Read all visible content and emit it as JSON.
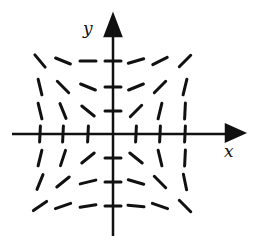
{
  "diagram": {
    "type": "slope_field",
    "axes": {
      "x_label": "x",
      "y_label": "y",
      "origin_px": [
        113,
        134
      ],
      "color": "#111111"
    },
    "grid": {
      "x_values": [
        -3,
        -2,
        -1,
        0,
        1,
        2,
        3
      ],
      "y_values": [
        3,
        2,
        1,
        0,
        -1,
        -2,
        -3
      ],
      "x_px": [
        40,
        63,
        88,
        113,
        136,
        160,
        185
      ],
      "y_px": [
        61,
        87,
        111,
        134,
        158,
        182,
        206
      ]
    },
    "segment_color": "#111111",
    "slopes": [
      {
        "y": 3,
        "values": [
          -1.2,
          -0.4,
          0.0,
          0.0,
          0.3,
          0.5,
          1.0
        ]
      },
      {
        "y": 2,
        "values": [
          -4.0,
          -1.0,
          -0.4,
          0.0,
          0.4,
          1.0,
          4.0
        ]
      },
      {
        "y": 1,
        "values": [
          -4.0,
          -2.5,
          -0.8,
          0.0,
          1.0,
          4.0,
          20.0
        ]
      },
      {
        "y": 0,
        "values": [
          20.0,
          20.0,
          20.0,
          null,
          20.0,
          20.0,
          20.0
        ]
      },
      {
        "y": -1,
        "values": [
          4.0,
          3.0,
          0.8,
          0.0,
          -0.8,
          -4.0,
          20.0
        ]
      },
      {
        "y": -2,
        "values": [
          2.5,
          0.8,
          0.25,
          0.0,
          -0.3,
          -1.0,
          -5.0
        ]
      },
      {
        "y": -3,
        "values": [
          0.7,
          0.35,
          0.15,
          0.0,
          -0.1,
          -0.35,
          -1.0
        ]
      }
    ]
  }
}
